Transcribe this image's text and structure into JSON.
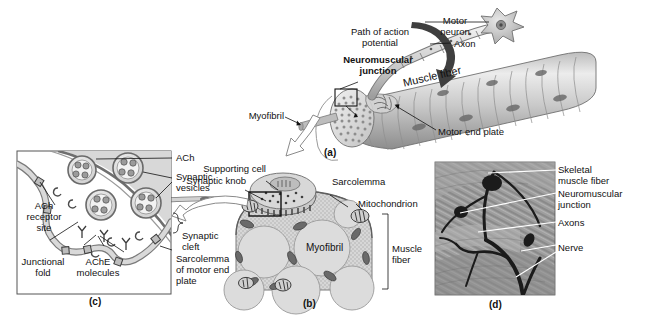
{
  "figure": {
    "background": "#ffffff",
    "ink": "#111111"
  },
  "panels": [
    {
      "id": "a",
      "letter": "(a)",
      "caption": "Whole muscle fiber with motor neuron and neuromuscular junction"
    },
    {
      "id": "b",
      "letter": "(b)",
      "caption": "Cross section of muscle fiber with synaptic knob"
    },
    {
      "id": "c",
      "letter": "(c)",
      "caption": "Detail of synaptic cleft and junctional folds"
    },
    {
      "id": "d",
      "letter": "(d)",
      "caption": "Light micrograph of nerve and neuromuscular junctions"
    }
  ],
  "panel_a": {
    "labels": {
      "path_of_action_potential": "Path of action\npotential",
      "neuromuscular_junction": "Neuromuscular\njunction",
      "motor_neuron": "Motor\nneuron",
      "axon": "Axon",
      "muscle_fiber": "Muscle fiber",
      "myofibril": "Myofibril",
      "motor_end_plate": "Motor end plate"
    }
  },
  "panel_b": {
    "labels": {
      "supporting_cell": "Supporting cell",
      "synaptic_knob": "Synaptic knob",
      "sarcolemma": "Sarcolemma",
      "mitochondrion": "Mitochondrion",
      "myofibril": "Myofibril",
      "muscle_fiber": "Muscle\nfiber"
    }
  },
  "panel_c": {
    "labels": {
      "ach": "ACh",
      "synaptic_vesicles": "Synaptic\nvesicles",
      "ach_receptor_site": "ACh\nreceptor\nsite",
      "junctional_fold": "Junctional\nfold",
      "ache_molecules": "AChE\nmolecules",
      "synaptic_cleft": "Synaptic\ncleft",
      "sarcolemma_of_motor_end_plate": "Sarcolemma\nof motor end\nplate"
    }
  },
  "panel_d": {
    "labels": {
      "skeletal_muscle_fiber": "Skeletal\nmuscle fiber",
      "neuromuscular_junction": "Neuromuscular\njunction",
      "axons": "Axons",
      "nerve": "Nerve"
    }
  },
  "colors": {
    "ink": "#111111",
    "muscle_light": "#dcdcdc",
    "muscle_mid": "#b8b8b8",
    "muscle_dark": "#8f8f8f",
    "cyto_fill": "#cfcfcf",
    "knob_fill": "#c6c6c6",
    "micrograph_bg": "#9a9a9a",
    "arrow_dark": "#3a3a3a",
    "arrow_hollow": "#ffffff"
  }
}
